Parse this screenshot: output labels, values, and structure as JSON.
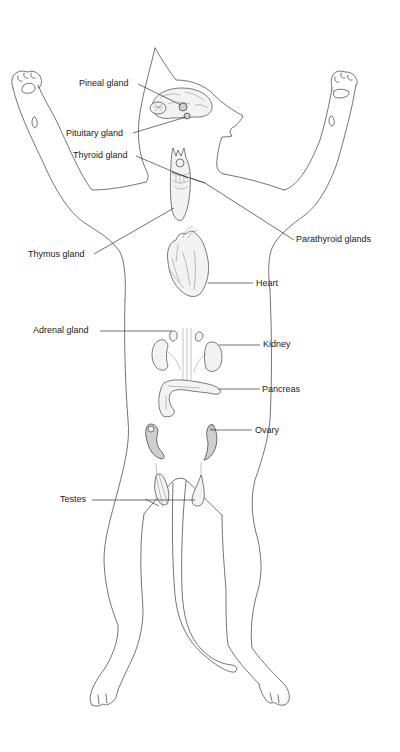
{
  "diagram": {
    "labels": {
      "pineal": "Pineal gland",
      "pituitary": "Pituitary gland",
      "thyroid": "Thyroid gland",
      "parathyroid": "Parathyroid glands",
      "thymus": "Thymus gland",
      "heart": "Heart",
      "adrenal": "Adrenal gland",
      "kidney": "Kidney",
      "pancreas": "Pancreas",
      "ovary": "Ovary",
      "testes": "Testes"
    },
    "colors": {
      "background": "#ffffff",
      "line": "#3a3a3a",
      "text": "#222222"
    }
  }
}
